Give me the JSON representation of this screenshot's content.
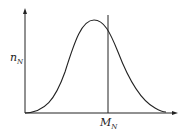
{
  "diagram": {
    "type": "distribution-curve",
    "y_axis_label": "n",
    "y_axis_subscript": "N",
    "x_axis_label": "M",
    "x_axis_subscript": "N",
    "curve": "bell-shaped, slightly right-skewed, peak left of the marked line",
    "marker": "vertical line at M_N",
    "colors": {
      "line": "#222222",
      "background": "#ffffff"
    }
  }
}
